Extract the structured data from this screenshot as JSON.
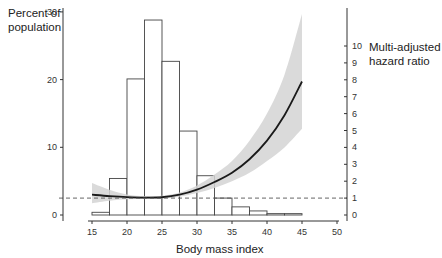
{
  "chart_data": {
    "type": "bar+line",
    "title": "",
    "xlabel": "Body mass index",
    "ylabel_left": "Percent of population",
    "ylabel_right": "Multi-adjusted hazard ratio",
    "xlim": [
      15,
      50
    ],
    "ylim_left": [
      0,
      30
    ],
    "ylim_right": [
      0,
      10
    ],
    "x_ticks": [
      15,
      20,
      25,
      30,
      35,
      40,
      45,
      50
    ],
    "y_ticks_left": [
      0,
      10,
      20,
      30
    ],
    "y_ticks_right": [
      0,
      1,
      2,
      3,
      4,
      5,
      6,
      7,
      8,
      9,
      10
    ],
    "grid": false,
    "reference_line": {
      "axis": "right",
      "value": 1,
      "style": "dashed"
    },
    "histogram": {
      "name": "Percent of population",
      "bin_edges": [
        15,
        17.5,
        20,
        22.5,
        25,
        27.5,
        30,
        32.5,
        35,
        37.5,
        40,
        42.5,
        45
      ],
      "values": [
        0.4,
        5.4,
        20.1,
        28.8,
        22.7,
        12.4,
        5.8,
        2.5,
        1.2,
        0.6,
        0.2,
        0.2
      ]
    },
    "series": [
      {
        "name": "Multi-adjusted hazard ratio",
        "axis": "right",
        "x": [
          15,
          17.5,
          20,
          22.5,
          25,
          27.5,
          30,
          32.5,
          35,
          37.5,
          40,
          42.5,
          45
        ],
        "values": [
          1.2,
          1.12,
          1.06,
          1.03,
          1.05,
          1.2,
          1.5,
          1.95,
          2.5,
          3.3,
          4.4,
          5.9,
          7.9
        ],
        "ci_lower": [
          0.7,
          0.85,
          0.93,
          0.95,
          0.97,
          1.08,
          1.3,
          1.6,
          2.0,
          2.5,
          3.2,
          4.0,
          5.1
        ],
        "ci_upper": [
          1.9,
          1.5,
          1.22,
          1.12,
          1.14,
          1.33,
          1.75,
          2.4,
          3.2,
          4.4,
          6.0,
          8.3,
          11.9
        ]
      }
    ]
  },
  "labels": {
    "left_axis_line1": "Percent of",
    "left_axis_line2": "population",
    "right_axis_line1": "Multi-adjusted",
    "right_axis_line2": "hazard ratio",
    "x_axis": "Body mass index"
  },
  "colors": {
    "bar_fill": "#ffffff",
    "bar_stroke": "#444444",
    "curve": "#1a1a1a",
    "ci_band": "#d3d3d3",
    "axis": "#333333",
    "ref_line": "#555555"
  }
}
